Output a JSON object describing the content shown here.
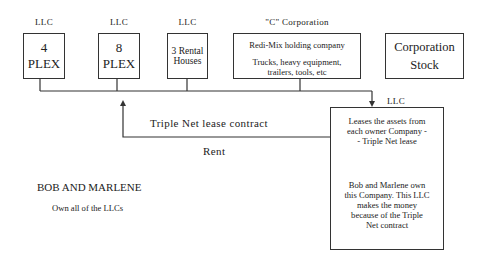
{
  "entities": [
    {
      "type_label": "LLC",
      "name": "4 PLEX"
    },
    {
      "type_label": "LLC",
      "name": "8 PLEX"
    },
    {
      "type_label": "LLC",
      "name": "3 Rental Houses"
    },
    {
      "type_label": "\"C\" Corporation",
      "name": "Redi-Mix holding company",
      "detail": "Trucks, heavy equipment, trailers, tools, etc"
    },
    {
      "type_label": "",
      "name": "Corporation Stock"
    }
  ],
  "leasing_llc": {
    "type_label": "LLC",
    "description": "Leases the assets from each owner Company -- Triple Net lease",
    "ownership_note": "Bob and Marlene own this Company. This LLC makes the money because of the Triple Net contract"
  },
  "flows": {
    "contract_label": "Triple Net lease contract",
    "payment_label": "Rent"
  },
  "owners": {
    "name": "BOB AND MARLENE",
    "note": "Own all of the LLCs"
  }
}
